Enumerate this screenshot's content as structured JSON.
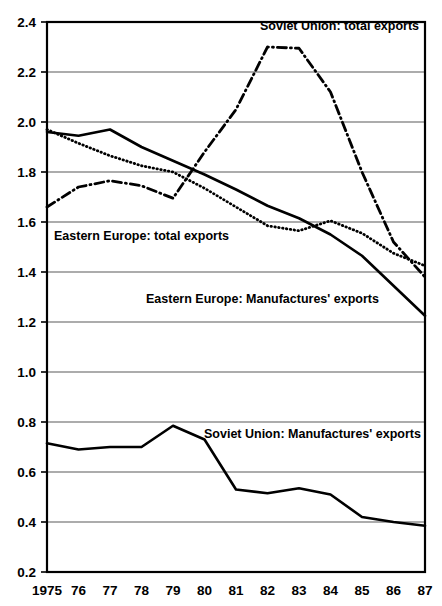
{
  "chart_data": {
    "type": "line",
    "title": "",
    "subtitle": "",
    "xlabel": "",
    "ylabel": "",
    "grid": true,
    "legend_position": "inline-annotations",
    "x": [
      1975,
      1976,
      1977,
      1978,
      1979,
      1980,
      1981,
      1982,
      1983,
      1984,
      1985,
      1986,
      1987
    ],
    "x_tick_labels": [
      "1975",
      "76",
      "77",
      "78",
      "79",
      "80",
      "81",
      "82",
      "83",
      "84",
      "85",
      "86",
      "87"
    ],
    "y_tick_labels": [
      "2.4",
      "2.2",
      "2.0",
      "1.8",
      "1.6",
      "1.4",
      "1.2",
      "1.0",
      "0.8",
      "0.6",
      "0.4",
      "0.2"
    ],
    "y_ticks": [
      2.4,
      2.2,
      2.0,
      1.8,
      1.6,
      1.4,
      1.2,
      1.0,
      0.8,
      0.6,
      0.4,
      0.2
    ],
    "xlim": [
      1975,
      1987
    ],
    "ylim": [
      0.2,
      2.4
    ],
    "series": [
      {
        "name": "Soviet Union: total exports",
        "style": "dash-dot",
        "label_text": "Soviet Union: total exports",
        "values": [
          1.66,
          1.74,
          1.765,
          1.745,
          1.695,
          1.88,
          2.05,
          2.3,
          2.295,
          2.12,
          1.8,
          1.52,
          1.38
        ]
      },
      {
        "name": "Eastern Europe: total exports",
        "style": "dotted",
        "label_text": "Eastern Europe: total exports",
        "values": [
          1.97,
          1.915,
          1.865,
          1.825,
          1.8,
          1.735,
          1.66,
          1.585,
          1.565,
          1.605,
          1.555,
          1.475,
          1.425
        ]
      },
      {
        "name": "Eastern Europe: Manufactures' exports",
        "style": "solid",
        "label_text": "Eastern Europe: Manufactures' exports",
        "values": [
          1.96,
          1.945,
          1.97,
          1.9,
          1.845,
          1.79,
          1.73,
          1.665,
          1.615,
          1.55,
          1.465,
          1.345,
          1.225
        ]
      },
      {
        "name": "Soviet Union: Manufactures' exports",
        "style": "solid",
        "label_text": "Soviet Union: Manufactures' exports",
        "values": [
          0.715,
          0.69,
          0.7,
          0.7,
          0.785,
          0.73,
          0.53,
          0.515,
          0.535,
          0.51,
          0.42,
          0.4,
          0.385
        ]
      }
    ],
    "annotations": [
      {
        "text": "Soviet Union: total exports",
        "x_px": 260,
        "y_px": 30
      },
      {
        "text": "Eastern Europe: total exports",
        "x_px": 54,
        "y_px": 240
      },
      {
        "text": "Eastern Europe: Manufactures' exports",
        "x_px": 146,
        "y_px": 303
      },
      {
        "text": "Soviet Union: Manufactures' exports",
        "x_px": 204,
        "y_px": 438
      }
    ]
  },
  "colors": {
    "ink": "#000000",
    "grid": "#5a5a5a",
    "background": "#ffffff"
  }
}
